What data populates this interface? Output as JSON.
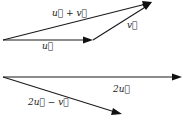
{
  "figure": {
    "top_diagram": {
      "vectors": [
        {
          "id": "u",
          "label": "u⃗",
          "from": [
            0,
            0
          ],
          "to": [
            2,
            0
          ]
        },
        {
          "id": "v",
          "label": "v⃗",
          "from": [
            2,
            0
          ],
          "to": [
            3.3,
            0.85
          ]
        },
        {
          "id": "u_plus_v",
          "label": "u⃗ + v⃗",
          "from": [
            0,
            0
          ],
          "to": [
            3.3,
            0.85
          ]
        }
      ]
    },
    "bottom_diagram": {
      "vectors": [
        {
          "id": "two_u",
          "label": "2u⃗",
          "from": [
            0,
            0
          ],
          "to": [
            4,
            0
          ]
        },
        {
          "id": "two_u_minus_v",
          "label": "2u⃗ − v⃗",
          "from": [
            0,
            0
          ],
          "to": [
            2.65,
            -0.83
          ]
        }
      ]
    },
    "colors": {
      "ink": "#111111",
      "background": "#ffffff"
    }
  }
}
